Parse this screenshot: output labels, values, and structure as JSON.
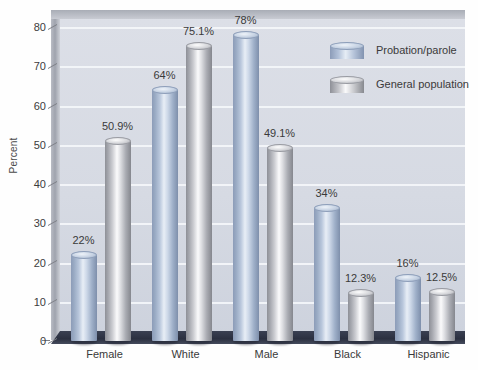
{
  "chart_data": {
    "type": "bar",
    "title": "",
    "xlabel": "",
    "ylabel": "Percent",
    "ylim": [
      0,
      80
    ],
    "yticks": [
      0,
      10,
      20,
      30,
      40,
      50,
      60,
      70,
      80
    ],
    "grid": true,
    "legend_position": "top-right",
    "categories": [
      "Female",
      "White",
      "Male",
      "Black",
      "Hispanic"
    ],
    "series": [
      {
        "name": "Probation/parole",
        "color": "#9aabc4",
        "values": [
          22,
          64,
          78,
          34,
          16
        ],
        "labels": [
          "22%",
          "64%",
          "78%",
          "34%",
          "16%"
        ]
      },
      {
        "name": "General population",
        "color": "#c0c2c7",
        "values": [
          50.9,
          75.1,
          49.1,
          12.3,
          12.5
        ],
        "labels": [
          "50.9%",
          "75.1%",
          "49.1%",
          "12.3%",
          "12.5%"
        ]
      }
    ]
  },
  "legend": {
    "items": [
      {
        "label": "Probation/parole",
        "swatch": "cylinder-blue-icon"
      },
      {
        "label": "General population",
        "swatch": "cylinder-gray-icon"
      }
    ]
  },
  "axes": {
    "y_title": "Percent",
    "y_tick_labels": [
      "0",
      "10",
      "20",
      "30",
      "40",
      "50",
      "60",
      "70",
      "80"
    ],
    "x_tick_labels": [
      "Female",
      "White",
      "Male",
      "Black",
      "Hispanic"
    ]
  }
}
